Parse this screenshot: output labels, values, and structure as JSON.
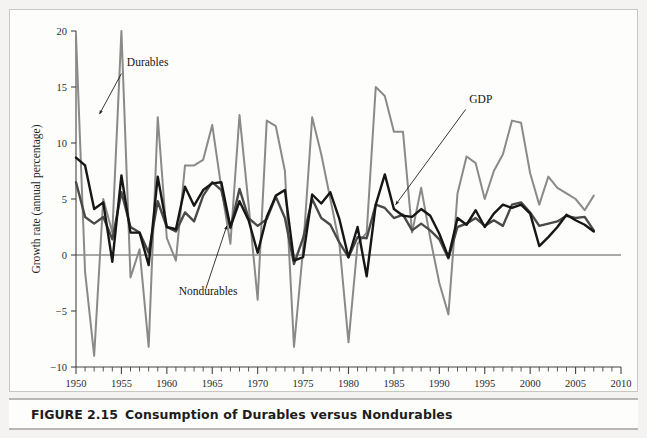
{
  "figure": {
    "caption_number": "FIGURE 2.15",
    "caption_title": "Consumption of Durables versus Nondurables"
  },
  "colors": {
    "durables": "#8a8a8a",
    "nondurables": "#4a4a4a",
    "gdp": "#161616",
    "axis": "#444444",
    "zero_line": "#555555",
    "page_background": "#f4f3f1",
    "panel_background": "#fdfdfc"
  },
  "annotations": [
    {
      "name": "durables",
      "label": "Durables",
      "text_x": 1955.6,
      "text_y": 16.9,
      "arrow_x1": 1955.0,
      "arrow_y1": 16.2,
      "arrow_x2": 1952.6,
      "arrow_y2": 12.6
    },
    {
      "name": "gdp",
      "label": "GDP",
      "text_x": 1993.3,
      "text_y": 13.6,
      "arrow_x1": 1992.9,
      "arrow_y1": 13.0,
      "arrow_x2": 1985.2,
      "arrow_y2": 4.5
    },
    {
      "name": "nondurables",
      "label": "Nondurables",
      "text_x": 1961.3,
      "text_y": -3.6,
      "arrow_x1": 1964.3,
      "arrow_y1": -3.0,
      "arrow_x2": 1966.6,
      "arrow_y2": 2.6
    }
  ],
  "chart_data": {
    "type": "line",
    "title": "Consumption of Durables versus Nondurables",
    "xlabel": "Year",
    "ylabel": "Growth rate (annual percentage)",
    "xlim": [
      1950,
      2010
    ],
    "ylim": [
      -10,
      20
    ],
    "xticks": [
      1950,
      1955,
      1960,
      1965,
      1970,
      1975,
      1980,
      1985,
      1990,
      1995,
      2000,
      2005,
      2010
    ],
    "xtick_labels": [
      "1950",
      "1955",
      "1960",
      "1965",
      "1970",
      "1975",
      "1980",
      "1985",
      "1990",
      "1995",
      "2000",
      "2005",
      "2010"
    ],
    "xminor_step": 1,
    "yticks": [
      -10,
      -5,
      0,
      5,
      10,
      15,
      20
    ],
    "ytick_labels": [
      "−10",
      "−5",
      "0",
      "5",
      "10",
      "15",
      "20"
    ],
    "grid": false,
    "zero_line": true,
    "legend": "annotated-inline",
    "x": [
      1950,
      1951,
      1952,
      1953,
      1954,
      1955,
      1956,
      1957,
      1958,
      1959,
      1960,
      1961,
      1962,
      1963,
      1964,
      1965,
      1966,
      1967,
      1968,
      1969,
      1970,
      1971,
      1972,
      1973,
      1974,
      1975,
      1976,
      1977,
      1978,
      1979,
      1980,
      1981,
      1982,
      1983,
      1984,
      1985,
      1986,
      1987,
      1988,
      1989,
      1990,
      1991,
      1992,
      1993,
      1994,
      1995,
      1996,
      1997,
      1998,
      1999,
      2000,
      2001,
      2002,
      2003,
      2004,
      2005,
      2006,
      2007
    ],
    "series": [
      {
        "name": "Durables",
        "color": "#8a8a8a",
        "width": 2.0,
        "values": [
          19.6,
          -1.5,
          -9.0,
          5.0,
          2.0,
          20.0,
          -2.0,
          0.5,
          -8.2,
          12.3,
          1.5,
          -0.5,
          8.0,
          8.0,
          8.5,
          11.6,
          6.0,
          1.0,
          12.5,
          4.5,
          -4.0,
          12.0,
          11.5,
          7.5,
          -8.2,
          0.5,
          12.3,
          9.0,
          5.0,
          1.0,
          -7.8,
          1.0,
          2.0,
          15.0,
          14.2,
          11.0,
          11.0,
          2.0,
          6.0,
          1.5,
          -2.5,
          -5.3,
          5.5,
          8.8,
          8.2,
          5.0,
          7.5,
          9.0,
          12.0,
          11.8,
          7.3,
          4.5,
          7.0,
          6.0,
          5.5,
          5.0,
          4.0,
          5.3
        ]
      },
      {
        "name": "Nondurables",
        "color": "#4a4a4a",
        "width": 2.4,
        "values": [
          6.5,
          3.4,
          2.8,
          3.4,
          1.4,
          5.6,
          2.5,
          2.0,
          0.2,
          4.8,
          2.5,
          2.1,
          3.8,
          3.0,
          5.3,
          6.5,
          5.8,
          2.4,
          5.9,
          3.3,
          2.6,
          3.2,
          5.2,
          3.3,
          -0.8,
          1.5,
          5.0,
          3.3,
          2.7,
          1.1,
          -0.2,
          1.6,
          1.5,
          4.5,
          4.2,
          3.3,
          3.6,
          2.2,
          2.8,
          2.2,
          1.4,
          -0.3,
          2.5,
          2.8,
          3.3,
          2.6,
          3.1,
          2.6,
          4.5,
          4.7,
          3.8,
          2.6,
          2.8,
          3.0,
          3.5,
          3.3,
          3.4,
          2.2
        ]
      },
      {
        "name": "GDP",
        "color": "#161616",
        "width": 2.4,
        "values": [
          8.7,
          8.0,
          4.1,
          4.7,
          -0.6,
          7.1,
          2.0,
          2.0,
          -0.9,
          7.0,
          2.5,
          2.3,
          6.1,
          4.4,
          5.8,
          6.4,
          6.5,
          2.5,
          4.8,
          3.1,
          0.2,
          3.4,
          5.3,
          5.8,
          -0.5,
          -0.2,
          5.4,
          4.6,
          5.6,
          3.2,
          -0.2,
          2.5,
          -1.9,
          4.5,
          7.2,
          4.1,
          3.5,
          3.4,
          4.1,
          3.5,
          1.9,
          -0.2,
          3.3,
          2.7,
          4.0,
          2.5,
          3.7,
          4.5,
          4.2,
          4.5,
          3.7,
          0.8,
          1.6,
          2.5,
          3.6,
          3.1,
          2.7,
          2.1
        ]
      }
    ]
  }
}
